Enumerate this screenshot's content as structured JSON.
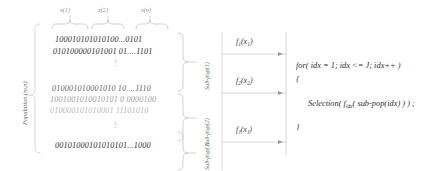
{
  "diagram": {
    "population_label": "Population (m,n)",
    "gene_labels": [
      {
        "text": "x(1)",
        "x": 62,
        "y": 9
      },
      {
        "text": "x(2)",
        "x": 100,
        "y": 9
      },
      {
        "text": "x(n)",
        "x": 143,
        "y": 9
      }
    ],
    "chromosomes": [
      {
        "text": "100010101010100...0101",
        "tone": "dark",
        "x": 55,
        "y": 37
      },
      {
        "text": "010100000101001 01....1101",
        "tone": "dark",
        "x": 53,
        "y": 49
      },
      {
        "text": "010001010001010 10....1110",
        "tone": "mid",
        "x": 52,
        "y": 86
      },
      {
        "text": "1001001010010101 0 0000100",
        "tone": "light",
        "x": 50,
        "y": 97
      },
      {
        "text": "010000101010001 11101010",
        "tone": "pale",
        "x": 50,
        "y": 108
      },
      {
        "text": "00101000101010101...1000",
        "tone": "dark",
        "x": 55,
        "y": 143
      }
    ],
    "dots_groups": [
      {
        "x": 114,
        "y": 62
      },
      {
        "x": 114,
        "y": 124
      }
    ],
    "subpopulations": [
      {
        "label": "Sub-pop(1)",
        "x": 208,
        "y": 63
      },
      {
        "label": "Sub-pop(2)",
        "x": 208,
        "y": 119
      },
      {
        "label": "Sub-pop(J)",
        "x": 208,
        "y": 165
      }
    ],
    "fitness_functions": [
      {
        "base": "f",
        "index": "1",
        "arg": "x",
        "argindex": "1",
        "text": "f1(x1)",
        "x": 237,
        "y": 42
      },
      {
        "base": "f",
        "index": "2",
        "arg": "x",
        "argindex": "2",
        "text": "f2(x2)",
        "x": 237,
        "y": 81
      },
      {
        "base": "f",
        "index": "J",
        "arg": "x",
        "argindex": "J",
        "text": "fJ(xJ)",
        "x": 237,
        "y": 130
      }
    ],
    "code_block": {
      "lines": [
        {
          "text": "for( idx = 1; idx <= J; idx++ )",
          "x": 284,
          "y": 66,
          "indent": 0
        },
        {
          "text": "{",
          "x": 284,
          "y": 79,
          "indent": 0
        },
        {
          "text": "Selection( fidx( sub-pop(idx) ) ) ;",
          "x": 296,
          "y": 102,
          "indent": 1
        },
        {
          "text": "}",
          "x": 284,
          "y": 126,
          "indent": 0
        }
      ],
      "selection_call": {
        "prefix": "Selection( f",
        "subscript": "idx",
        "suffix": "( sub-pop(idx) ) ) ;"
      }
    },
    "colors": {
      "stroke": "#b9b9b9",
      "stroke_light": "#cfcfcf",
      "text_dark": "#2c2c2c",
      "text_mid": "#5f5f5f",
      "text_light": "#9d9d9d",
      "background": "#ffffff"
    }
  }
}
